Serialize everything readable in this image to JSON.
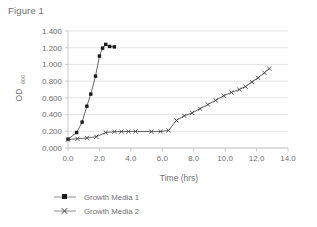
{
  "figure": {
    "title": "Figure 1"
  },
  "chart_data": {
    "type": "line",
    "title": "Figure 1",
    "xlabel": "Time (hrs)",
    "ylabel": "OD",
    "ylabel_subscript": "600",
    "xlim": [
      0.0,
      14.0
    ],
    "ylim": [
      0.0,
      1.4
    ],
    "xticks": [
      "0.0",
      "2.0",
      "4.0",
      "6.0",
      "8.0",
      "10.0",
      "12.0",
      "14.0"
    ],
    "xtick_values": [
      0.0,
      2.0,
      4.0,
      6.0,
      8.0,
      10.0,
      12.0,
      14.0
    ],
    "yticks": [
      "0.000",
      "0.200",
      "0.400",
      "0.600",
      "0.800",
      "1.000",
      "1.200",
      "1.400"
    ],
    "ytick_values": [
      0.0,
      0.2,
      0.4,
      0.6,
      0.8,
      1.0,
      1.2,
      1.4
    ],
    "grid": "horizontal",
    "legend_position": "bottom",
    "series": [
      {
        "name": "Growth Media 1",
        "marker": "square",
        "color": "#1a1a1a",
        "points": [
          [
            0.0,
            0.105
          ],
          [
            0.55,
            0.185
          ],
          [
            0.9,
            0.31
          ],
          [
            1.2,
            0.5
          ],
          [
            1.45,
            0.645
          ],
          [
            1.75,
            0.86
          ],
          [
            2.0,
            1.1
          ],
          [
            2.2,
            1.195
          ],
          [
            2.4,
            1.24
          ],
          [
            2.65,
            1.215
          ],
          [
            2.95,
            1.21
          ]
        ]
      },
      {
        "name": "Growth Media 2",
        "marker": "cross",
        "color": "#3f3f3f",
        "points": [
          [
            0.0,
            0.1
          ],
          [
            0.6,
            0.11
          ],
          [
            1.2,
            0.12
          ],
          [
            1.8,
            0.135
          ],
          [
            2.4,
            0.185
          ],
          [
            2.95,
            0.195
          ],
          [
            3.4,
            0.196
          ],
          [
            3.85,
            0.197
          ],
          [
            4.3,
            0.198
          ],
          [
            5.3,
            0.196
          ],
          [
            5.9,
            0.198
          ],
          [
            6.4,
            0.21
          ],
          [
            6.9,
            0.33
          ],
          [
            7.4,
            0.385
          ],
          [
            7.9,
            0.42
          ],
          [
            8.4,
            0.47
          ],
          [
            8.9,
            0.52
          ],
          [
            9.4,
            0.57
          ],
          [
            9.9,
            0.625
          ],
          [
            10.4,
            0.665
          ],
          [
            10.9,
            0.7
          ],
          [
            11.3,
            0.735
          ],
          [
            11.7,
            0.79
          ],
          [
            12.1,
            0.84
          ],
          [
            12.5,
            0.9
          ],
          [
            12.8,
            0.95
          ]
        ]
      }
    ]
  },
  "legend": {
    "items": [
      {
        "label": "Growth Media 1",
        "marker": "square"
      },
      {
        "label": "Growth Media 2",
        "marker": "cross"
      }
    ]
  }
}
